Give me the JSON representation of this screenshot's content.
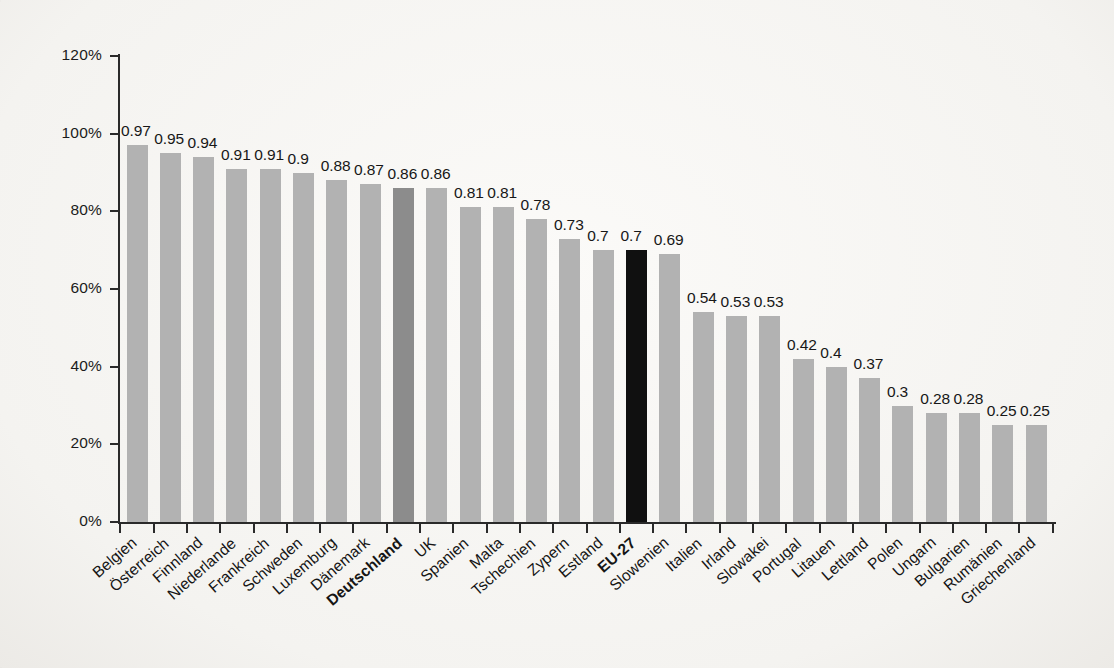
{
  "chart_data": {
    "type": "bar",
    "title": "",
    "subtitle": "",
    "xlabel": "",
    "ylabel": "",
    "ylim": [
      0,
      1.2
    ],
    "grid": false,
    "legend": false,
    "y_tick_labels": [
      "0%",
      "20%",
      "40%",
      "60%",
      "80%",
      "100%",
      "120%"
    ],
    "y_tick_values": [
      0,
      0.2,
      0.4,
      0.6,
      0.8,
      1.0,
      1.2
    ],
    "categories": [
      "Belgien",
      "Österreich",
      "Finnland",
      "Niederlande",
      "Frankreich",
      "Schweden",
      "Luxemburg",
      "Dänemark",
      "Deutschland",
      "UK",
      "Spanien",
      "Malta",
      "Tschechien",
      "Zypern",
      "Estland",
      "EU-27",
      "Slowenien",
      "Italien",
      "Irland",
      "Slowakei",
      "Portugal",
      "Litauen",
      "Lettland",
      "Polen",
      "Ungarn",
      "Bulgarien",
      "Rumänien",
      "Griechenland"
    ],
    "values": [
      0.97,
      0.95,
      0.94,
      0.91,
      0.91,
      0.9,
      0.88,
      0.87,
      0.86,
      0.86,
      0.81,
      0.81,
      0.78,
      0.73,
      0.7,
      0.7,
      0.69,
      0.54,
      0.53,
      0.53,
      0.42,
      0.4,
      0.37,
      0.3,
      0.28,
      0.28,
      0.25,
      0.25
    ],
    "value_labels": [
      "0.97",
      "0.95",
      "0.94",
      "0.91",
      "0.91",
      "0.9",
      "0.88",
      "0.87",
      "0.86",
      "0.86",
      "0.81",
      "0.81",
      "0.78",
      "0.73",
      "0.7",
      "0.7",
      "0.69",
      "0.54",
      "0.53",
      "0.53",
      "0.42",
      "0.4",
      "0.37",
      "0.3",
      "0.28",
      "0.28",
      "0.25",
      "0.25"
    ],
    "highlighted": {
      "Deutschland": "dark-gray",
      "EU-27": "black"
    },
    "bold_categories": [
      "Deutschland",
      "EU-27"
    ],
    "colors": {
      "bar_default": "#b2b2b2",
      "bar_deutschland": "#8c8c8c",
      "bar_eu27": "#101010",
      "axis": "#2a2a2a",
      "text": "#171717",
      "background": "#f8f7f5"
    }
  }
}
